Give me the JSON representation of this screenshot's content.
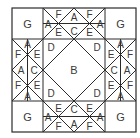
{
  "diagram": {
    "type": "quilt-block-pattern",
    "colors": {
      "line": "#2b2b2b",
      "label": "#3a3a3a",
      "background": "#ffffff"
    },
    "corners": {
      "top_left": "G",
      "top_right": "G",
      "bottom_left": "G",
      "bottom_right": "G"
    },
    "center": {
      "diamond": "B",
      "corner_tl": "D",
      "corner_tr": "D",
      "corner_bl": "D",
      "corner_br": "D"
    },
    "top_edge": {
      "left": "A",
      "top_left": "F",
      "bottom_left": "E",
      "top_mid": "A",
      "bottom_mid": "C",
      "top_right": "F",
      "bottom_right": "E",
      "right": "A"
    },
    "bottom_edge": {
      "left": "A",
      "top_left": "E",
      "bottom_left": "F",
      "top_mid": "C",
      "bottom_mid": "A",
      "top_right": "E",
      "bottom_right": "F",
      "right": "A"
    },
    "left_edge": {
      "top": "A",
      "left_top": "F",
      "right_top": "E",
      "left_mid": "A",
      "right_mid": "C",
      "left_bottom": "F",
      "right_bottom": "E",
      "bottom": "A"
    },
    "right_edge": {
      "top": "A",
      "left_top": "E",
      "right_top": "F",
      "left_mid": "C",
      "right_mid": "A",
      "left_bottom": "E",
      "right_bottom": "F",
      "bottom": "A"
    }
  }
}
